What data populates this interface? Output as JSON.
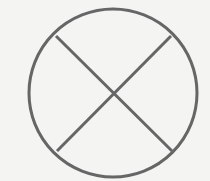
{
  "diagram": {
    "title": "",
    "shapes": [
      {
        "type": "circle",
        "cx": 113,
        "cy": 93,
        "r": 84
      },
      {
        "type": "line",
        "x1": 56,
        "y1": 36,
        "x2": 172,
        "y2": 151
      },
      {
        "type": "line",
        "x1": 171,
        "y1": 36,
        "x2": 57,
        "y2": 151
      }
    ],
    "colors": {
      "stroke": "#666666",
      "background": "#f4f4f2"
    }
  }
}
